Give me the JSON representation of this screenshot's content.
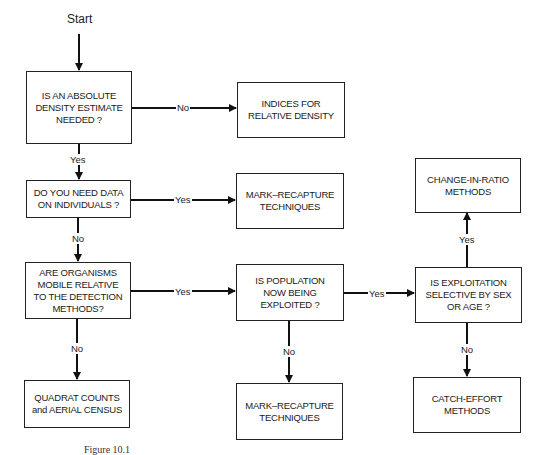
{
  "diagram": {
    "type": "flowchart",
    "start_label": "Start",
    "nodes": {
      "q_absolute": "IS AN ABSOLUTE\nDENSITY ESTIMATE\nNEEDED ?",
      "r_indices": "INDICES FOR\nRELATIVE DENSITY",
      "q_individuals": "DO YOU NEED DATA\nON INDIVIDUALS ?",
      "r_mark_recapture_1": "MARK–RECAPTURE\nTECHNIQUES",
      "q_mobile": "ARE ORGANISMS\nMOBILE RELATIVE\nTO THE DETECTION\nMETHODS?",
      "q_exploited": "IS POPULATION\nNOW BEING\nEXPLOITED ?",
      "q_selective": "IS EXPLOITATION\nSELECTIVE BY SEX\nOR AGE ?",
      "r_change_in_ratio": "CHANGE-IN-RATIO\nMETHODS",
      "r_quadrat": "QUADRAT COUNTS\nand AERIAL CENSUS",
      "r_mark_recapture_2": "MARK–RECAPTURE\nTECHNIQUES",
      "r_catch_effort": "CATCH-EFFORT\nMETHODS"
    },
    "edge_labels": {
      "absolute_no": "No",
      "absolute_yes": "Yes",
      "individuals_yes": "Yes",
      "individuals_no": "No",
      "mobile_yes": "Yes",
      "mobile_no": "No",
      "exploited_yes": "Yes",
      "exploited_no": "No",
      "selective_yes": "Yes",
      "selective_no": "No"
    },
    "edges": [
      {
        "from": "start",
        "to": "q_absolute",
        "label": ""
      },
      {
        "from": "q_absolute",
        "to": "r_indices",
        "label": "No"
      },
      {
        "from": "q_absolute",
        "to": "q_individuals",
        "label": "Yes"
      },
      {
        "from": "q_individuals",
        "to": "r_mark_recapture_1",
        "label": "Yes"
      },
      {
        "from": "q_individuals",
        "to": "q_mobile",
        "label": "No"
      },
      {
        "from": "q_mobile",
        "to": "q_exploited",
        "label": "Yes"
      },
      {
        "from": "q_mobile",
        "to": "r_quadrat",
        "label": "No"
      },
      {
        "from": "q_exploited",
        "to": "q_selective",
        "label": "Yes"
      },
      {
        "from": "q_exploited",
        "to": "r_mark_recapture_2",
        "label": "No"
      },
      {
        "from": "q_selective",
        "to": "r_change_in_ratio",
        "label": "Yes"
      },
      {
        "from": "q_selective",
        "to": "r_catch_effort",
        "label": "No"
      }
    ],
    "caption": "Figure 10.1"
  }
}
